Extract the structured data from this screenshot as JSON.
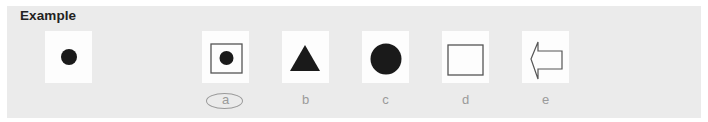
{
  "section": {
    "title": "Example"
  },
  "example_card": {
    "shape": "small-filled-circle"
  },
  "options": [
    {
      "label": "a",
      "shape": "filled-circle-in-square",
      "selected": true
    },
    {
      "label": "b",
      "shape": "filled-triangle",
      "selected": false
    },
    {
      "label": "c",
      "shape": "large-filled-circle",
      "selected": false
    },
    {
      "label": "d",
      "shape": "outline-rectangle",
      "selected": false
    },
    {
      "label": "e",
      "shape": "outline-left-arrow",
      "selected": false
    }
  ],
  "colors": {
    "panel": "#ebebeb",
    "card": "#fdfdfd",
    "shape_fill": "#1a1a1a",
    "outline": "#555555",
    "label": "#9a9a9a",
    "title": "#222222"
  }
}
